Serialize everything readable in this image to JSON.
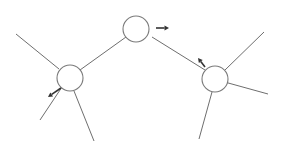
{
  "diagram": {
    "type": "tree-graph",
    "colors": {
      "edge": "#6e6e6e",
      "node_stroke": "#7a7a7a",
      "node_fill": "#ffffff",
      "arrow": "#333333",
      "background": "#ffffff"
    },
    "nodes": [
      {
        "id": "top",
        "cx": 136,
        "cy": 29,
        "r": 13
      },
      {
        "id": "left",
        "cx": 70,
        "cy": 78,
        "r": 13
      },
      {
        "id": "right",
        "cx": 215,
        "cy": 79,
        "r": 13
      }
    ],
    "edges": [
      {
        "id": "left-top",
        "x1": 80,
        "y1": 70,
        "x2": 126,
        "y2": 37
      },
      {
        "id": "top-right",
        "x1": 152,
        "y1": 37,
        "x2": 205,
        "y2": 70
      },
      {
        "id": "left-upper",
        "x1": 16,
        "y1": 34,
        "x2": 59,
        "y2": 69
      },
      {
        "id": "left-lower-left",
        "x1": 64,
        "y1": 84,
        "x2": 40,
        "y2": 120
      },
      {
        "id": "left-lower-right",
        "x1": 74,
        "y1": 91,
        "x2": 94,
        "y2": 141
      },
      {
        "id": "right-upper",
        "x1": 225,
        "y1": 70,
        "x2": 264,
        "y2": 32
      },
      {
        "id": "right-side",
        "x1": 221,
        "y1": 81,
        "x2": 268,
        "y2": 94
      },
      {
        "id": "right-lower",
        "x1": 212,
        "y1": 92,
        "x2": 199,
        "y2": 139
      }
    ],
    "arrows": [
      {
        "id": "top-arrow",
        "direction": "right",
        "x1": 156,
        "y1": 28,
        "x2": 169,
        "y2": 28
      },
      {
        "id": "left-arrow",
        "direction": "down-left",
        "x1": 61,
        "y1": 88,
        "x2": 48,
        "y2": 97
      },
      {
        "id": "right-arrow",
        "direction": "up-left",
        "x1": 205,
        "y1": 67,
        "x2": 198,
        "y2": 58
      }
    ]
  }
}
